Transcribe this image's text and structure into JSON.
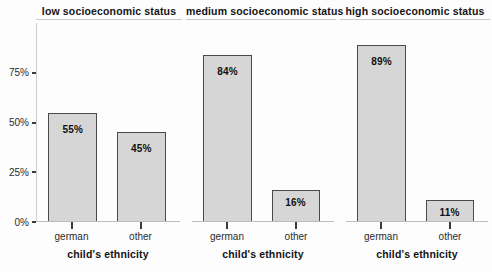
{
  "chart_data": {
    "type": "bar",
    "title": "",
    "subtitle": "",
    "xlabel": "child's ethnicity",
    "ylabel": "",
    "ylim": [
      0,
      100
    ],
    "grid": false,
    "legend": "none",
    "faceted": true,
    "facet_titles": [
      "low socioeconomic status",
      "medium socioeconomic status",
      "high socioeconomic status"
    ],
    "categories": [
      "german",
      "other"
    ],
    "ytick_labels": [
      "0%",
      "25%",
      "50%",
      "75%"
    ],
    "ytick_values": [
      0,
      25,
      50,
      75
    ],
    "panels": [
      {
        "facet": "low socioeconomic status",
        "xlabel": "child's ethnicity",
        "bars": [
          {
            "category": "german",
            "value": 55,
            "label": "55%"
          },
          {
            "category": "other",
            "value": 45,
            "label": "45%"
          }
        ]
      },
      {
        "facet": "medium socioeconomic status",
        "xlabel": "child's ethnicity",
        "bars": [
          {
            "category": "german",
            "value": 84,
            "label": "84%"
          },
          {
            "category": "other",
            "value": 16,
            "label": "16%"
          }
        ]
      },
      {
        "facet": "high socioeconomic status",
        "xlabel": "child's ethnicity",
        "bars": [
          {
            "category": "german",
            "value": 89,
            "label": "89%"
          },
          {
            "category": "other",
            "value": 11,
            "label": "11%"
          }
        ]
      }
    ],
    "colors": {
      "bar_fill": "#d6d6d6",
      "bar_border": "#4a4a4a",
      "axis": "#bdbdbd",
      "text": "#141414",
      "background": "#fdfdfd"
    }
  }
}
